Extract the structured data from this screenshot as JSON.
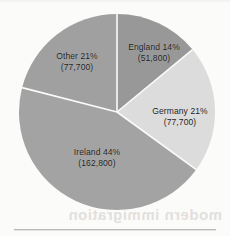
{
  "chart_data": {
    "type": "pie",
    "title": "",
    "categories": [
      "England",
      "Germany",
      "Ireland",
      "Other"
    ],
    "values": [
      14,
      21,
      44,
      21
    ],
    "counts": [
      51800,
      77700,
      162800,
      77700
    ],
    "legend": "none",
    "start_angle_deg": 0,
    "direction": "clockwise",
    "slices": [
      {
        "name": "England",
        "label": "England 14%",
        "value_label": "(51,800)",
        "percent": 14,
        "count": 51800,
        "color": "#989898",
        "start_deg": 0,
        "end_deg": 50.4
      },
      {
        "name": "Germany",
        "label": "Germany 21%",
        "value_label": "(77,700)",
        "percent": 21,
        "count": 77700,
        "color": "#dcdcdc",
        "start_deg": 50.4,
        "end_deg": 126.0
      },
      {
        "name": "Ireland",
        "label": "Ireland 44%",
        "value_label": "(162,800)",
        "percent": 44,
        "count": 162800,
        "color": "#a3a3a3",
        "start_deg": 126.0,
        "end_deg": 284.4
      },
      {
        "name": "Other",
        "label": "Other 21%",
        "value_label": "(77,700)",
        "percent": 21,
        "count": 77700,
        "color": "#a0a0a0",
        "start_deg": 284.4,
        "end_deg": 360.0
      }
    ]
  },
  "page": {
    "background_color": "#fbfbfa",
    "separator_color": "#b9b9b9",
    "bleed_through_text": "modern immigration"
  }
}
